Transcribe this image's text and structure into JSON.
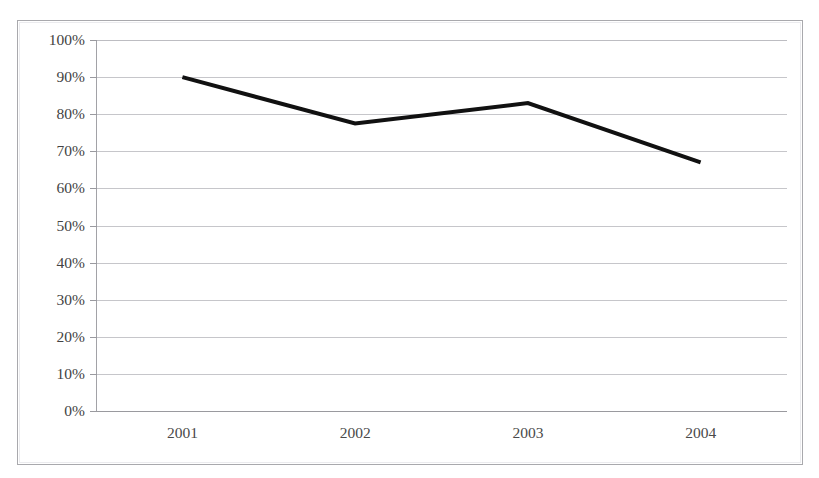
{
  "figure": {
    "clipped_title": " ",
    "frame_color": "#a9a9ad",
    "background_color": "#ffffff"
  },
  "chart_data": {
    "type": "line",
    "title": "",
    "xlabel": "",
    "ylabel": "",
    "categories": [
      "2001",
      "2002",
      "2003",
      "2004"
    ],
    "x": [
      2001,
      2002,
      2003,
      2004
    ],
    "values": [
      90,
      77.5,
      83,
      67
    ],
    "series": [
      {
        "name": "",
        "values": [
          90,
          77.5,
          83,
          67
        ],
        "color": "#111111",
        "line_width": 4,
        "markers": false
      }
    ],
    "ylim": [
      0,
      100
    ],
    "ytick_values": [
      0,
      10,
      20,
      30,
      40,
      50,
      60,
      70,
      80,
      90,
      100
    ],
    "ytick_labels": [
      "0%",
      "10%",
      "20%",
      "30%",
      "40%",
      "50%",
      "60%",
      "70%",
      "80%",
      "90%",
      "100%"
    ],
    "xtick_labels": [
      "2001",
      "2002",
      "2003",
      "2004"
    ],
    "grid": "horizontal",
    "gridline_color": "#c6c6ca",
    "legend": "none",
    "legend_position": "none",
    "annotations": []
  },
  "axis": {
    "y_labels": [
      {
        "text": "100%",
        "value": 100
      },
      {
        "text": "90%",
        "value": 90
      },
      {
        "text": "80%",
        "value": 80
      },
      {
        "text": "70%",
        "value": 70
      },
      {
        "text": "60%",
        "value": 60
      },
      {
        "text": "50%",
        "value": 50
      },
      {
        "text": "40%",
        "value": 40
      },
      {
        "text": "30%",
        "value": 30
      },
      {
        "text": "20%",
        "value": 20
      },
      {
        "text": "10%",
        "value": 10
      },
      {
        "text": "0%",
        "value": 0
      }
    ],
    "x_labels": [
      {
        "text": "2001"
      },
      {
        "text": "2002"
      },
      {
        "text": "2003"
      },
      {
        "text": "2004"
      }
    ]
  }
}
